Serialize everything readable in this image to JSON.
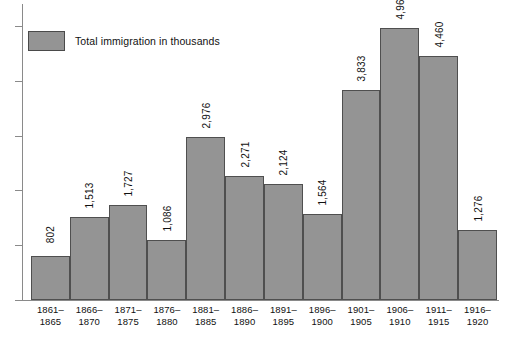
{
  "chart_data": {
    "type": "bar",
    "title": "",
    "subtitle": "",
    "xlabel": "",
    "ylabel": "",
    "legend": [
      {
        "label": "Total immigration in thousands",
        "color": "#949494"
      }
    ],
    "legend_position": "top-left",
    "grid": false,
    "axis": {
      "y_tick_labels_visible": false,
      "y_tick_count": 9,
      "ylim": [
        0,
        5400
      ],
      "y_tick_step": 1000
    },
    "categories": [
      "1861–1865",
      "1866–1870",
      "1871–1875",
      "1876–1880",
      "1881–1885",
      "1886–1890",
      "1891–1895",
      "1896–1900",
      "1901–1905",
      "1906–1910",
      "1911–1915",
      "1916–1920"
    ],
    "category_lines": [
      {
        "top": "1861–",
        "bottom": "1865"
      },
      {
        "top": "1866–",
        "bottom": "1870"
      },
      {
        "top": "1871–",
        "bottom": "1875"
      },
      {
        "top": "1876–",
        "bottom": "1880"
      },
      {
        "top": "1881–",
        "bottom": "1885"
      },
      {
        "top": "1886–",
        "bottom": "1890"
      },
      {
        "top": "1891–",
        "bottom": "1895"
      },
      {
        "top": "1896–",
        "bottom": "1900"
      },
      {
        "top": "1901–",
        "bottom": "1905"
      },
      {
        "top": "1906–",
        "bottom": "1910"
      },
      {
        "top": "1911–",
        "bottom": "1915"
      },
      {
        "top": "1916–",
        "bottom": "1920"
      }
    ],
    "values": [
      802,
      1513,
      1727,
      1086,
      2976,
      2271,
      2124,
      1564,
      3833,
      4962,
      4460,
      1276
    ],
    "value_labels": [
      "802",
      "1,513",
      "1,727",
      "1,086",
      "2,976",
      "2,271",
      "2,124",
      "1,564",
      "3,833",
      "4,962",
      "4,460",
      "1,276"
    ],
    "colors": {
      "bar_fill": "#949494",
      "bar_border": "#4f4f4f",
      "axis": "#8a8a8a",
      "text": "#111111",
      "background": "#ffffff"
    }
  }
}
